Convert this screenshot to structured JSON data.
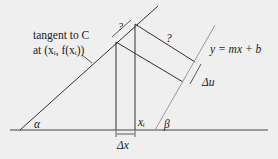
{
  "diagram": {
    "labels": {
      "tangent_line1": "tangent to C",
      "tangent_line2": "at (xᵢ, f(xᵢ))",
      "line_equation": "y = mx + b",
      "alpha": "α",
      "beta": "β",
      "delta_x": "Δx",
      "delta_u": "Δu",
      "x_i": "xᵢ",
      "unknown_top": "?",
      "unknown_right": "?"
    },
    "colors": {
      "background": "#efefef",
      "line": "#333333",
      "gray_line": "#999999"
    }
  }
}
